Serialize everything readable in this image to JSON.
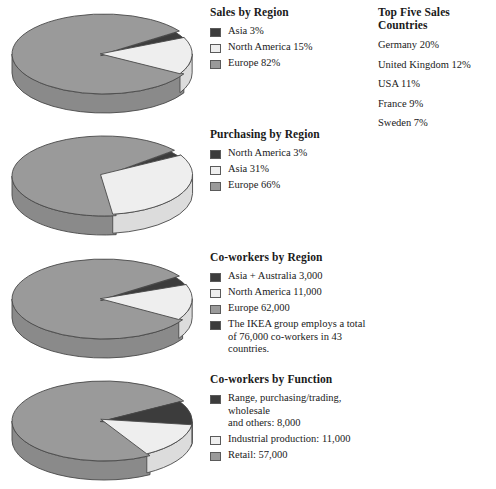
{
  "colors": {
    "dark": "#3c3c3c",
    "light": "#eeeeee",
    "mid": "#9a9a9a",
    "outline": "#4a4a4a",
    "dark_side": "#2a2a2a",
    "light_side": "#dcdcdc",
    "mid_side": "#8a8a8a"
  },
  "countries_panel": {
    "title": "Top Five Sales Countries",
    "items": [
      "Germany 20%",
      "United Kingdom 12%",
      "USA 11%",
      "France 9%",
      "Sweden 7%"
    ]
  },
  "charts": [
    {
      "title": "Sales by Region",
      "legend": [
        {
          "swatch": "dark",
          "label": "Asia 3%"
        },
        {
          "swatch": "light",
          "label": "North America 15%"
        },
        {
          "swatch": "mid",
          "label": "Europe 82%"
        }
      ]
    },
    {
      "title": "Purchasing by Region",
      "legend": [
        {
          "swatch": "dark",
          "label": "North America 3%"
        },
        {
          "swatch": "light",
          "label": "Asia 31%"
        },
        {
          "swatch": "mid",
          "label": "Europe 66%"
        }
      ]
    },
    {
      "title": "Co-workers by Region",
      "legend": [
        {
          "swatch": "dark",
          "label": "Asia + Australia 3,000"
        },
        {
          "swatch": "light",
          "label": "North America 11,000"
        },
        {
          "swatch": "mid",
          "label": "Europe 62,000"
        },
        {
          "swatch": "dark",
          "label": "The IKEA group employs a total\nof 76,000 co-workers in 43 countries."
        }
      ]
    },
    {
      "title": "Co-workers by Function",
      "legend": [
        {
          "swatch": "dark",
          "label": "Range, purchasing/trading, wholesale\nand others: 8,000"
        },
        {
          "swatch": "light",
          "label": "Industrial production: 11,000"
        },
        {
          "swatch": "mid",
          "label": "Retail: 57,000"
        }
      ]
    }
  ],
  "chart_data": [
    {
      "type": "pie",
      "title": "Sales by Region",
      "categories": [
        "Asia",
        "North America",
        "Europe"
      ],
      "values": [
        3,
        15,
        82
      ],
      "unit": "percent",
      "labels": [
        "Asia 3%",
        "North America 15%",
        "Europe 82%"
      ],
      "colors": [
        "#3c3c3c",
        "#eeeeee",
        "#9a9a9a"
      ],
      "exploded": [
        "Asia",
        "North America"
      ],
      "legend_position": "right",
      "grid": false
    },
    {
      "type": "pie",
      "title": "Purchasing by Region",
      "categories": [
        "North America",
        "Asia",
        "Europe"
      ],
      "values": [
        3,
        31,
        66
      ],
      "unit": "percent",
      "labels": [
        "North America 3%",
        "Asia 31%",
        "Europe 66%"
      ],
      "colors": [
        "#3c3c3c",
        "#eeeeee",
        "#9a9a9a"
      ],
      "exploded": [
        "North America",
        "Asia"
      ],
      "legend_position": "right",
      "grid": false
    },
    {
      "type": "pie",
      "title": "Co-workers by Region",
      "categories": [
        "Asia + Australia",
        "North America",
        "Europe"
      ],
      "values": [
        3000,
        11000,
        62000
      ],
      "unit": "co-workers",
      "labels": [
        "Asia + Australia 3,000",
        "North America 11,000",
        "Europe 62,000"
      ],
      "colors": [
        "#3c3c3c",
        "#eeeeee",
        "#9a9a9a"
      ],
      "exploded": [
        "Asia + Australia",
        "North America"
      ],
      "annotation": "The IKEA group employs a total of 76,000 co-workers in 43 countries.",
      "total": 76000,
      "countries": 43,
      "legend_position": "right",
      "grid": false
    },
    {
      "type": "pie",
      "title": "Co-workers by Function",
      "categories": [
        "Range, purchasing/trading, wholesale and others",
        "Industrial production",
        "Retail"
      ],
      "values": [
        8000,
        11000,
        57000
      ],
      "unit": "co-workers",
      "labels": [
        "Range, purchasing/trading, wholesale and others: 8,000",
        "Industrial production: 11,000",
        "Retail: 57,000"
      ],
      "colors": [
        "#3c3c3c",
        "#eeeeee",
        "#9a9a9a"
      ],
      "exploded": [
        "Range, purchasing/trading, wholesale and others",
        "Industrial production"
      ],
      "legend_position": "right",
      "grid": false
    },
    {
      "type": "table",
      "title": "Top Five Sales Countries",
      "categories": [
        "Germany",
        "United Kingdom",
        "USA",
        "France",
        "Sweden"
      ],
      "values": [
        20,
        12,
        11,
        9,
        7
      ],
      "unit": "percent"
    }
  ]
}
